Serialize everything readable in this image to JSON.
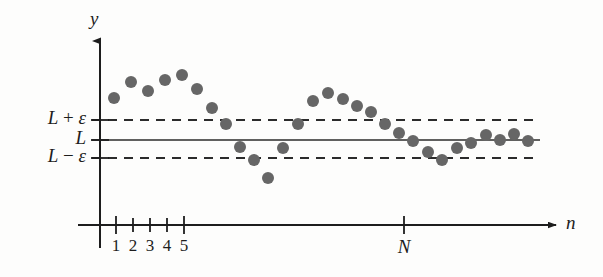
{
  "figure": {
    "colors": {
      "point": "#666666",
      "axis": "#1d1d1d",
      "line": "#2b2b2b",
      "background": "#fdfdfc"
    }
  },
  "axes": {
    "y_axis_label": "y",
    "x_axis_label": "n",
    "origin": {
      "x": 100,
      "y": 225
    },
    "y_axis_top": 32,
    "x_axis_right": 556
  },
  "levels": [
    {
      "name": "upper",
      "prefix": "L",
      "operator": "+",
      "symbol": "ε",
      "text": "L + ε",
      "y": 120,
      "style": "dashed"
    },
    {
      "name": "limit",
      "prefix": "L",
      "operator": "",
      "symbol": "",
      "text": "L",
      "y": 140,
      "style": "solid"
    },
    {
      "name": "lower",
      "prefix": "L",
      "operator": "−",
      "symbol": "ε",
      "text": "L − ε",
      "y": 158,
      "style": "dashed"
    }
  ],
  "x_ticks": [
    {
      "label": "1",
      "x": 116
    },
    {
      "label": "2",
      "x": 133
    },
    {
      "label": "3",
      "x": 150
    },
    {
      "label": "4",
      "x": 167
    },
    {
      "label": "5",
      "x": 184
    },
    {
      "label": "N",
      "x": 404
    }
  ],
  "band": {
    "left": 100,
    "right": 540
  },
  "chart_data": {
    "type": "scatter",
    "xlabel": "n",
    "ylabel": "y",
    "grid": false,
    "legend": null,
    "xlim": [
      0,
      603
    ],
    "ylim": [
      277,
      0
    ],
    "reference_lines": [
      {
        "label": "L + ε",
        "y": 120,
        "dash": true
      },
      {
        "label": "L",
        "y": 140,
        "dash": false
      },
      {
        "label": "L − ε",
        "y": 158,
        "dash": true
      }
    ],
    "point_radius": 6,
    "points": [
      {
        "n": 1,
        "x": 114,
        "y": 98
      },
      {
        "n": 2,
        "x": 131,
        "y": 82
      },
      {
        "n": 3,
        "x": 148,
        "y": 91
      },
      {
        "n": 4,
        "x": 165,
        "y": 80
      },
      {
        "n": 5,
        "x": 182,
        "y": 75
      },
      {
        "n": 6,
        "x": 197,
        "y": 89
      },
      {
        "n": 7,
        "x": 212,
        "y": 108
      },
      {
        "n": 8,
        "x": 226,
        "y": 124
      },
      {
        "n": 9,
        "x": 240,
        "y": 147
      },
      {
        "n": 10,
        "x": 254,
        "y": 160
      },
      {
        "n": 11,
        "x": 268,
        "y": 178
      },
      {
        "n": 12,
        "x": 283,
        "y": 148
      },
      {
        "n": 13,
        "x": 298,
        "y": 124
      },
      {
        "n": 14,
        "x": 313,
        "y": 101
      },
      {
        "n": 15,
        "x": 328,
        "y": 93
      },
      {
        "n": 16,
        "x": 343,
        "y": 99
      },
      {
        "n": 17,
        "x": 357,
        "y": 106
      },
      {
        "n": 18,
        "x": 371,
        "y": 112
      },
      {
        "n": 19,
        "x": 385,
        "y": 124
      },
      {
        "n": 20,
        "x": 399,
        "y": 133
      },
      {
        "n": 21,
        "x": 413,
        "y": 141
      },
      {
        "n": 22,
        "x": 428,
        "y": 152
      },
      {
        "n": 23,
        "x": 442,
        "y": 160
      },
      {
        "n": 24,
        "x": 457,
        "y": 148
      },
      {
        "n": 25,
        "x": 471,
        "y": 143
      },
      {
        "n": 26,
        "x": 486,
        "y": 135
      },
      {
        "n": 27,
        "x": 500,
        "y": 140
      },
      {
        "n": 28,
        "x": 514,
        "y": 134
      },
      {
        "n": 29,
        "x": 528,
        "y": 141
      }
    ]
  }
}
